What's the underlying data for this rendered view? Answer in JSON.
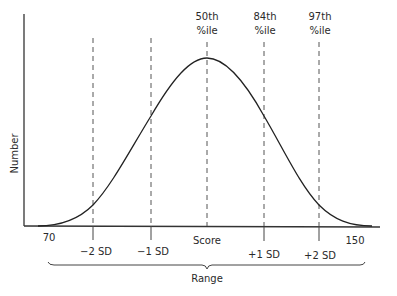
{
  "diagram": {
    "y_axis_label": "Number",
    "x_axis_label": "Score",
    "range_label": "Range",
    "min_label": "70",
    "max_label": "150",
    "sd_markers": [
      {
        "label": "−2 SD"
      },
      {
        "label": "−1 SD"
      },
      {
        "label": "+1 SD"
      },
      {
        "label": "+2 SD"
      }
    ],
    "percentile_labels": [
      {
        "line1": "50th",
        "line2": "%ile"
      },
      {
        "line1": "84th",
        "line2": "%ile"
      },
      {
        "line1": "97th",
        "line2": "%ile"
      }
    ]
  }
}
